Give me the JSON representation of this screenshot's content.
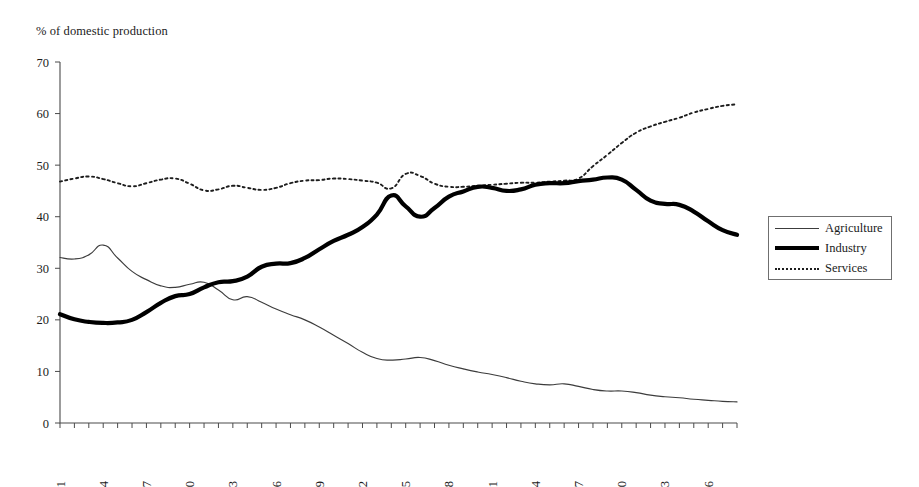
{
  "chart_data": {
    "type": "line",
    "title": "% of domestic production",
    "xlabel": "",
    "ylabel": "% of domestic production",
    "ylim": [
      0,
      70
    ],
    "ytick_step": 10,
    "yticks": [
      "0",
      "10",
      "20",
      "30",
      "40",
      "50",
      "60",
      "70"
    ],
    "xlim": [
      1951,
      1998
    ],
    "xtick_step": 3,
    "xticks": [
      "1951",
      "1954",
      "1957",
      "1960",
      "1963",
      "1966",
      "1969",
      "1972",
      "1975",
      "1978",
      "1981",
      "1984",
      "1987",
      "1990",
      "1993",
      "1996"
    ],
    "xtick_rotation": 90,
    "grid": false,
    "legend_position": "right",
    "x": [
      1951,
      1952,
      1953,
      1954,
      1955,
      1956,
      1957,
      1958,
      1959,
      1960,
      1961,
      1962,
      1963,
      1964,
      1965,
      1966,
      1967,
      1968,
      1969,
      1970,
      1971,
      1972,
      1973,
      1974,
      1975,
      1976,
      1977,
      1978,
      1979,
      1980,
      1981,
      1982,
      1983,
      1984,
      1985,
      1986,
      1987,
      1988,
      1989,
      1990,
      1991,
      1992,
      1993,
      1994,
      1995,
      1996,
      1997,
      1998
    ],
    "series": [
      {
        "name": "Agriculture",
        "style": "thin-solid",
        "color": "#3c3c3c",
        "values": [
          32.1,
          31.8,
          32.6,
          34.5,
          32.0,
          29.4,
          27.8,
          26.6,
          26.3,
          26.9,
          27.3,
          25.8,
          23.9,
          24.5,
          23.4,
          22.1,
          21.0,
          20.0,
          18.6,
          17.0,
          15.4,
          13.7,
          12.5,
          12.2,
          12.4,
          12.7,
          12.1,
          11.2,
          10.5,
          9.9,
          9.4,
          8.8,
          8.1,
          7.6,
          7.4,
          7.6,
          7.1,
          6.5,
          6.2,
          6.2,
          5.9,
          5.4,
          5.1,
          4.9,
          4.6,
          4.4,
          4.2,
          4.1
        ]
      },
      {
        "name": "Industry",
        "style": "thick-solid",
        "color": "#000000",
        "values": [
          21.1,
          20.1,
          19.6,
          19.4,
          19.5,
          20.0,
          21.5,
          23.3,
          24.6,
          25.0,
          26.3,
          27.3,
          27.5,
          28.4,
          30.3,
          30.9,
          31.0,
          32.0,
          33.7,
          35.3,
          36.5,
          38.0,
          40.4,
          44.1,
          42.0,
          40.0,
          41.7,
          43.9,
          44.9,
          45.8,
          45.6,
          45.0,
          45.3,
          46.2,
          46.5,
          46.5,
          46.9,
          47.2,
          47.6,
          47.2,
          45.2,
          43.1,
          42.5,
          42.3,
          41.0,
          39.1,
          37.4,
          36.5
        ]
      },
      {
        "name": "Services",
        "style": "dotted",
        "color": "#1d1d1d",
        "values": [
          46.8,
          47.4,
          47.8,
          47.3,
          46.5,
          45.9,
          46.5,
          47.2,
          47.4,
          46.4,
          45.1,
          45.3,
          46.0,
          45.6,
          45.2,
          45.6,
          46.5,
          47.0,
          47.1,
          47.4,
          47.3,
          47.0,
          46.6,
          45.5,
          48.3,
          47.9,
          46.4,
          45.8,
          45.8,
          46.0,
          46.2,
          46.4,
          46.6,
          46.6,
          46.8,
          47.0,
          47.4,
          49.8,
          52.0,
          54.3,
          56.3,
          57.5,
          58.4,
          59.2,
          60.2,
          60.9,
          61.5,
          61.8
        ]
      }
    ]
  },
  "legend": {
    "items": [
      {
        "label": "Agriculture"
      },
      {
        "label": "Industry"
      },
      {
        "label": "Services"
      }
    ]
  }
}
